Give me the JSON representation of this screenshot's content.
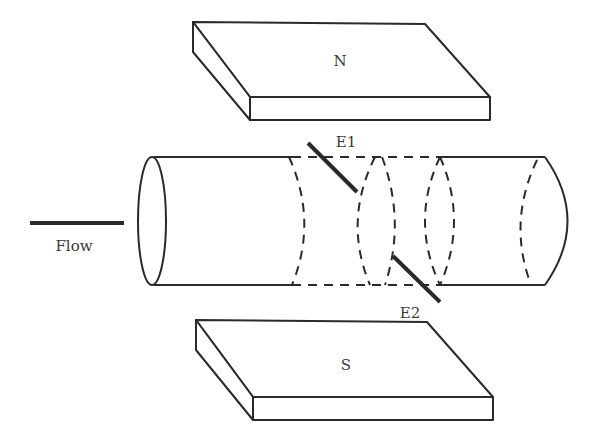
{
  "diagram": {
    "magnets": {
      "north": {
        "label": "N"
      },
      "south": {
        "label": "S"
      }
    },
    "electrodes": [
      {
        "label": "E1"
      },
      {
        "label": "E2"
      }
    ],
    "flow": {
      "label": "Flow"
    },
    "colors": {
      "stroke": "#2a2a2a",
      "background": "#ffffff"
    }
  }
}
